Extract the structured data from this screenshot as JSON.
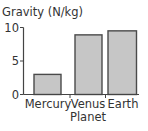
{
  "chart_data": {
    "type": "bar",
    "title": "",
    "ylabel": "Gravity (N/kg)",
    "xlabel": "Planet",
    "categories": [
      "Mercury",
      "Venus",
      "Earth"
    ],
    "values": [
      3.0,
      8.9,
      9.5
    ],
    "ylim": [
      0,
      10
    ],
    "yticks": [
      0,
      5,
      10
    ],
    "grid": false,
    "legend": null
  },
  "colors": {
    "bar_fill": "#c6c6c6",
    "bar_stroke": "#4a4a4a",
    "axis": "#444444",
    "text": "#333333"
  }
}
